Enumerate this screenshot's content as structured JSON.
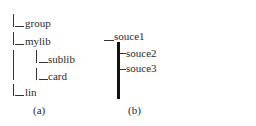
{
  "figure_a": {
    "caption": "(a)",
    "nodes": [
      {
        "label": "group",
        "level": 0
      },
      {
        "label": "mylib",
        "level": 0
      },
      {
        "label": "sublib",
        "level": 1
      },
      {
        "label": "card",
        "level": 1
      },
      {
        "label": "lin",
        "level": 0
      }
    ]
  },
  "figure_b": {
    "caption": "(b)",
    "root": "souce1",
    "children": [
      "souce2",
      "souce3"
    ]
  }
}
